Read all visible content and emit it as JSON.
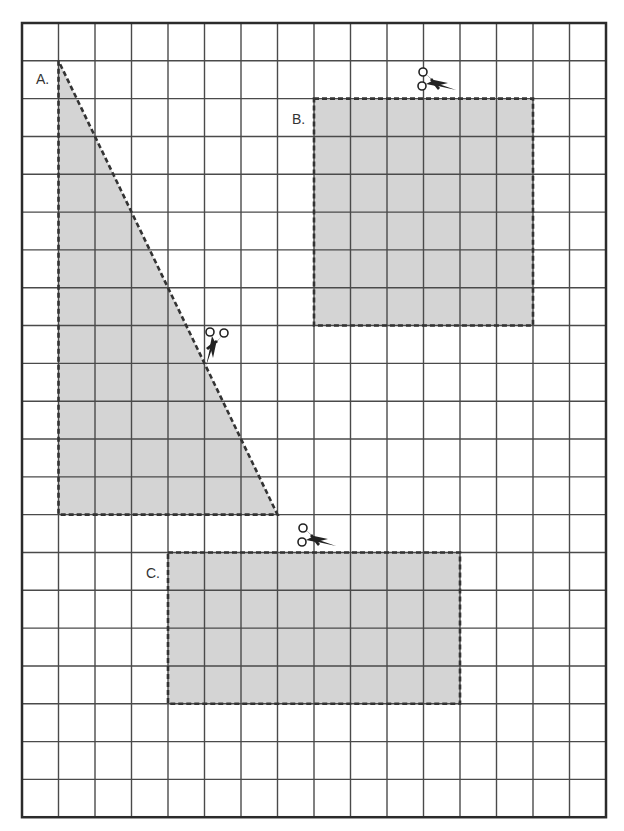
{
  "grid": {
    "origin_x": 22,
    "origin_y": 23,
    "cols": 16,
    "rows": 21,
    "cell_w": 36.5,
    "cell_h": 37.82,
    "line_color": "#4a4a4a",
    "border_color": "#2b2b2b"
  },
  "colors": {
    "fill": "#d4d4d4",
    "dash": "#333333",
    "label": "#333333",
    "scissors": "#222222"
  },
  "shapes": [
    {
      "id": "A",
      "label": "A.",
      "type": "right-triangle",
      "vertices_grid": [
        [
          1,
          1
        ],
        [
          1,
          13
        ],
        [
          7,
          13
        ]
      ],
      "width_units": 6,
      "height_units": 12,
      "label_pos": [
        36,
        72
      ],
      "scissors": {
        "x": 198,
        "y": 326,
        "rotate": 90
      }
    },
    {
      "id": "B",
      "label": "B.",
      "type": "rectangle",
      "col": 8,
      "row": 2,
      "w": 6,
      "h": 6,
      "label_pos": [
        292,
        112
      ],
      "scissors": {
        "x": 416,
        "y": 66,
        "rotate": 0
      }
    },
    {
      "id": "C",
      "label": "C.",
      "type": "rectangle",
      "col": 4,
      "row": 14,
      "w": 8,
      "h": 4,
      "label_pos": [
        146,
        566
      ],
      "scissors": {
        "x": 296,
        "y": 522,
        "rotate": 0
      }
    }
  ]
}
